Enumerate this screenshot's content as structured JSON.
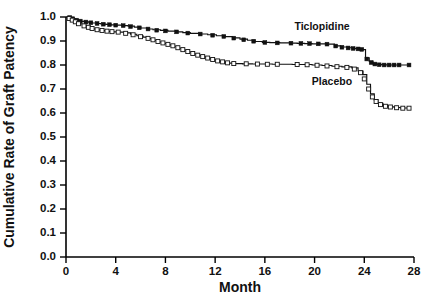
{
  "chart_data": {
    "type": "line",
    "title": "",
    "subtitle": "",
    "xlabel": "Month",
    "ylabel": "Cumulative Rate of Graft Patency",
    "xlim": [
      0,
      28
    ],
    "ylim": [
      0.0,
      1.0
    ],
    "xticks": [
      0,
      4,
      8,
      12,
      16,
      20,
      24,
      28
    ],
    "xticklabels": [
      "0",
      "4",
      "8",
      "12",
      "16",
      "20",
      "24",
      "28"
    ],
    "yticks": [
      0.0,
      0.1,
      0.2,
      0.3,
      0.4,
      0.5,
      0.6,
      0.7,
      0.8,
      0.9,
      1.0
    ],
    "yticklabels": [
      "0.0",
      "0.1",
      "0.2",
      "0.3",
      "0.4",
      "0.5",
      "0.6",
      "0.7",
      "0.8",
      "0.9",
      "1.0"
    ],
    "grid": false,
    "legend_position": "inline-annotations",
    "style": "kaplan-meier step curves with censoring marks",
    "annotations": [
      {
        "text": "Ticlopidine",
        "x": 20.6,
        "y": 0.945
      },
      {
        "text": "Placebo",
        "x": 21.4,
        "y": 0.715
      }
    ],
    "series": [
      {
        "name": "Ticlopidine",
        "marker": "filled-square",
        "color": "#111111",
        "final_value": 0.8,
        "points": [
          [
            0.0,
            1.0
          ],
          [
            0.25,
            0.998
          ],
          [
            0.45,
            0.995
          ],
          [
            0.6,
            0.992
          ],
          [
            0.8,
            0.988
          ],
          [
            1.0,
            0.985
          ],
          [
            1.25,
            0.982
          ],
          [
            1.5,
            0.98
          ],
          [
            1.8,
            0.978
          ],
          [
            2.1,
            0.975
          ],
          [
            2.45,
            0.973
          ],
          [
            2.8,
            0.971
          ],
          [
            3.2,
            0.969
          ],
          [
            3.6,
            0.967
          ],
          [
            4.0,
            0.966
          ],
          [
            4.5,
            0.964
          ],
          [
            5.0,
            0.962
          ],
          [
            5.5,
            0.958
          ],
          [
            6.0,
            0.954
          ],
          [
            6.5,
            0.95
          ],
          [
            7.0,
            0.947
          ],
          [
            7.6,
            0.944
          ],
          [
            8.2,
            0.941
          ],
          [
            8.8,
            0.938
          ],
          [
            9.4,
            0.935
          ],
          [
            10.0,
            0.932
          ],
          [
            10.7,
            0.929
          ],
          [
            11.4,
            0.926
          ],
          [
            12.1,
            0.922
          ],
          [
            12.8,
            0.918
          ],
          [
            13.4,
            0.913
          ],
          [
            14.0,
            0.908
          ],
          [
            14.6,
            0.903
          ],
          [
            15.2,
            0.898
          ],
          [
            15.8,
            0.894
          ],
          [
            16.4,
            0.893
          ],
          [
            17.2,
            0.892
          ],
          [
            18.0,
            0.891
          ],
          [
            18.6,
            0.89
          ],
          [
            19.2,
            0.889
          ],
          [
            19.8,
            0.888
          ],
          [
            20.4,
            0.888
          ],
          [
            21.0,
            0.887
          ],
          [
            21.6,
            0.88
          ],
          [
            22.1,
            0.875
          ],
          [
            22.6,
            0.872
          ],
          [
            23.0,
            0.87
          ],
          [
            23.3,
            0.868
          ],
          [
            23.6,
            0.866
          ],
          [
            23.9,
            0.864
          ],
          [
            24.1,
            0.83
          ],
          [
            24.4,
            0.815
          ],
          [
            24.7,
            0.806
          ],
          [
            25.0,
            0.802
          ],
          [
            25.4,
            0.801
          ],
          [
            25.8,
            0.8
          ],
          [
            26.2,
            0.8
          ],
          [
            26.6,
            0.8
          ],
          [
            27.0,
            0.8
          ],
          [
            27.6,
            0.8
          ]
        ],
        "censor_marks": [
          [
            0.3,
            0.998
          ],
          [
            0.55,
            0.993
          ],
          [
            0.85,
            0.987
          ],
          [
            1.15,
            0.983
          ],
          [
            1.6,
            0.979
          ],
          [
            2.0,
            0.976
          ],
          [
            2.5,
            0.973
          ],
          [
            3.0,
            0.97
          ],
          [
            3.5,
            0.968
          ],
          [
            4.0,
            0.966
          ],
          [
            4.6,
            0.964
          ],
          [
            5.2,
            0.96
          ],
          [
            5.9,
            0.955
          ],
          [
            6.6,
            0.95
          ],
          [
            7.3,
            0.945
          ],
          [
            8.0,
            0.942
          ],
          [
            8.9,
            0.938
          ],
          [
            9.8,
            0.933
          ],
          [
            10.8,
            0.929
          ],
          [
            11.8,
            0.924
          ],
          [
            12.7,
            0.919
          ],
          [
            13.5,
            0.912
          ],
          [
            14.3,
            0.905
          ],
          [
            15.1,
            0.899
          ],
          [
            16.0,
            0.894
          ],
          [
            17.0,
            0.892
          ],
          [
            18.1,
            0.891
          ],
          [
            18.9,
            0.89
          ],
          [
            19.6,
            0.889
          ],
          [
            20.3,
            0.888
          ],
          [
            21.0,
            0.887
          ],
          [
            21.7,
            0.879
          ],
          [
            22.2,
            0.874
          ],
          [
            22.7,
            0.871
          ],
          [
            23.1,
            0.869
          ],
          [
            23.5,
            0.867
          ],
          [
            23.8,
            0.865
          ],
          [
            24.2,
            0.825
          ],
          [
            24.55,
            0.81
          ],
          [
            24.85,
            0.804
          ],
          [
            25.2,
            0.801
          ],
          [
            25.6,
            0.8
          ],
          [
            26.0,
            0.8
          ],
          [
            26.4,
            0.8
          ],
          [
            26.8,
            0.8
          ],
          [
            27.6,
            0.8
          ]
        ]
      },
      {
        "name": "Placebo",
        "marker": "open-square",
        "color": "#111111",
        "final_value": 0.62,
        "points": [
          [
            0.0,
            1.0
          ],
          [
            0.2,
            0.996
          ],
          [
            0.4,
            0.99
          ],
          [
            0.6,
            0.984
          ],
          [
            0.8,
            0.978
          ],
          [
            1.0,
            0.972
          ],
          [
            1.3,
            0.966
          ],
          [
            1.6,
            0.96
          ],
          [
            1.9,
            0.955
          ],
          [
            2.2,
            0.95
          ],
          [
            2.6,
            0.946
          ],
          [
            3.0,
            0.943
          ],
          [
            3.4,
            0.94
          ],
          [
            3.8,
            0.938
          ],
          [
            4.2,
            0.937
          ],
          [
            4.7,
            0.934
          ],
          [
            5.2,
            0.928
          ],
          [
            5.7,
            0.922
          ],
          [
            6.2,
            0.916
          ],
          [
            6.7,
            0.91
          ],
          [
            7.1,
            0.903
          ],
          [
            7.5,
            0.896
          ],
          [
            7.9,
            0.89
          ],
          [
            8.3,
            0.884
          ],
          [
            8.7,
            0.878
          ],
          [
            9.1,
            0.87
          ],
          [
            9.5,
            0.862
          ],
          [
            9.9,
            0.854
          ],
          [
            10.3,
            0.846
          ],
          [
            10.7,
            0.84
          ],
          [
            11.1,
            0.834
          ],
          [
            11.5,
            0.828
          ],
          [
            11.9,
            0.822
          ],
          [
            12.3,
            0.816
          ],
          [
            12.7,
            0.812
          ],
          [
            13.1,
            0.808
          ],
          [
            13.6,
            0.806
          ],
          [
            14.2,
            0.805
          ],
          [
            15.0,
            0.804
          ],
          [
            15.8,
            0.804
          ],
          [
            16.6,
            0.803
          ],
          [
            17.4,
            0.803
          ],
          [
            18.2,
            0.802
          ],
          [
            19.0,
            0.802
          ],
          [
            19.8,
            0.8
          ],
          [
            20.6,
            0.798
          ],
          [
            21.4,
            0.795
          ],
          [
            22.2,
            0.792
          ],
          [
            23.0,
            0.788
          ],
          [
            23.5,
            0.775
          ],
          [
            23.9,
            0.76
          ],
          [
            24.2,
            0.72
          ],
          [
            24.5,
            0.68
          ],
          [
            24.8,
            0.655
          ],
          [
            25.1,
            0.64
          ],
          [
            25.5,
            0.63
          ],
          [
            25.9,
            0.626
          ],
          [
            26.4,
            0.623
          ],
          [
            26.9,
            0.621
          ],
          [
            27.6,
            0.62
          ]
        ],
        "censor_marks": [
          [
            0.25,
            0.994
          ],
          [
            0.5,
            0.987
          ],
          [
            0.75,
            0.98
          ],
          [
            1.0,
            0.972
          ],
          [
            1.45,
            0.963
          ],
          [
            1.8,
            0.957
          ],
          [
            2.1,
            0.952
          ],
          [
            2.5,
            0.947
          ],
          [
            2.9,
            0.944
          ],
          [
            3.3,
            0.941
          ],
          [
            3.7,
            0.939
          ],
          [
            4.2,
            0.937
          ],
          [
            4.8,
            0.932
          ],
          [
            5.4,
            0.926
          ],
          [
            6.0,
            0.918
          ],
          [
            6.6,
            0.911
          ],
          [
            7.0,
            0.905
          ],
          [
            7.4,
            0.898
          ],
          [
            7.8,
            0.892
          ],
          [
            8.2,
            0.886
          ],
          [
            8.6,
            0.88
          ],
          [
            9.0,
            0.872
          ],
          [
            9.4,
            0.864
          ],
          [
            9.8,
            0.856
          ],
          [
            10.2,
            0.848
          ],
          [
            10.6,
            0.841
          ],
          [
            11.0,
            0.835
          ],
          [
            11.4,
            0.829
          ],
          [
            11.8,
            0.823
          ],
          [
            12.2,
            0.817
          ],
          [
            12.6,
            0.813
          ],
          [
            13.0,
            0.809
          ],
          [
            13.5,
            0.806
          ],
          [
            14.5,
            0.805
          ],
          [
            15.4,
            0.804
          ],
          [
            16.2,
            0.803
          ],
          [
            17.0,
            0.803
          ],
          [
            18.6,
            0.802
          ],
          [
            19.4,
            0.801
          ],
          [
            20.2,
            0.799
          ],
          [
            21.0,
            0.796
          ],
          [
            21.8,
            0.793
          ],
          [
            22.6,
            0.79
          ],
          [
            23.2,
            0.783
          ],
          [
            23.7,
            0.768
          ],
          [
            24.0,
            0.742
          ],
          [
            24.35,
            0.7
          ],
          [
            24.65,
            0.667
          ],
          [
            24.95,
            0.648
          ],
          [
            25.3,
            0.635
          ],
          [
            25.7,
            0.628
          ],
          [
            26.1,
            0.625
          ],
          [
            26.6,
            0.622
          ],
          [
            27.1,
            0.62
          ],
          [
            27.6,
            0.62
          ]
        ]
      }
    ]
  }
}
